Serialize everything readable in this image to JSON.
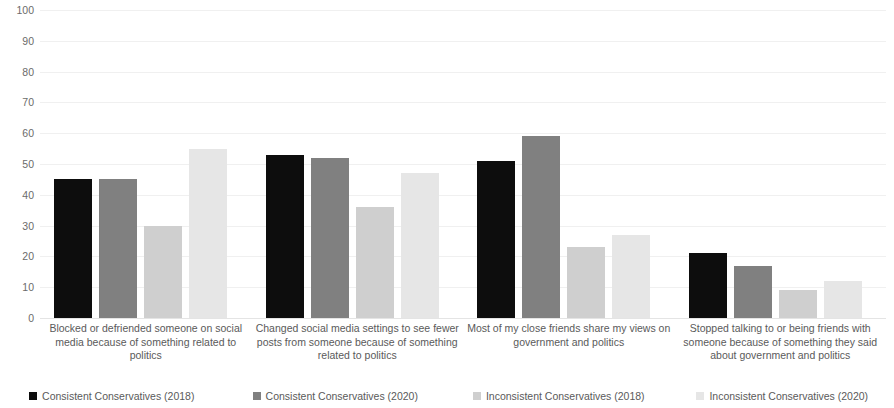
{
  "chart_data": {
    "type": "bar",
    "title": "",
    "subtitle": "",
    "xlabel": "",
    "ylabel": "",
    "ylim": [
      0,
      100
    ],
    "ytick_step": 10,
    "yticks": [
      100,
      90,
      80,
      70,
      60,
      50,
      40,
      30,
      20,
      10,
      0
    ],
    "grid": true,
    "grid_axis": "y",
    "legend_position": "bottom",
    "categories": [
      "Blocked or defriended someone on social media because of something related to politics",
      "Changed social media settings to see fewer posts from someone because of something related to politics",
      "Most of my close friends share my views on government and politics",
      "Stopped talking to or being friends with someone because of something they said about government and politics"
    ],
    "series": [
      {
        "name": "Consistent Conservatives (2018)",
        "color": "#0d0d0d",
        "values": [
          45,
          53,
          51,
          21
        ]
      },
      {
        "name": "Consistent Conservatives (2020)",
        "color": "#808080",
        "values": [
          45,
          52,
          59,
          17
        ]
      },
      {
        "name": "Inconsistent Conservatives (2018)",
        "color": "#cfcfcf",
        "values": [
          30,
          36,
          23,
          9
        ]
      },
      {
        "name": "Inconsistent Conservatives (2020)",
        "color": "#e6e6e6",
        "values": [
          55,
          47,
          27,
          12
        ]
      }
    ]
  }
}
